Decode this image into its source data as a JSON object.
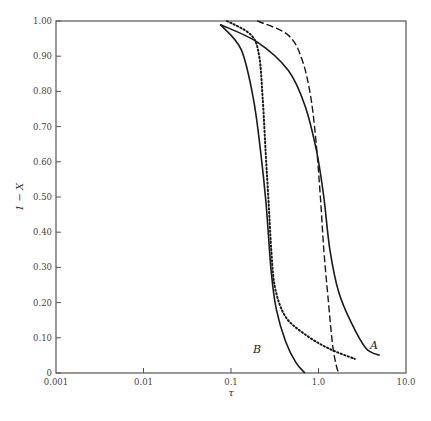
{
  "chart_data": {
    "type": "line",
    "title": "",
    "xlabel": "τ",
    "ylabel": "1 − X",
    "xscale": "log",
    "xlim": [
      0.001,
      10.0
    ],
    "ylim": [
      0,
      1.0
    ],
    "grid": false,
    "x_ticks": [
      "0.001",
      "0.01",
      "0.1",
      "1.0",
      "10.0"
    ],
    "y_ticks": [
      "0",
      "0.10",
      "0.20",
      "0.30",
      "0.40",
      "0.50",
      "0.60",
      "0.70",
      "0.80",
      "0.90",
      "1.00"
    ],
    "annotations": [
      {
        "text": "A",
        "x": 4.3,
        "y": 0.07
      },
      {
        "text": "B",
        "x": 0.25,
        "y": 0.07
      }
    ],
    "series": [
      {
        "name": "B (solid)",
        "style": "solid",
        "points": [
          [
            0.075,
            0.99
          ],
          [
            0.13,
            0.92
          ],
          [
            0.18,
            0.78
          ],
          [
            0.22,
            0.62
          ],
          [
            0.25,
            0.49
          ],
          [
            0.27,
            0.38
          ],
          [
            0.29,
            0.28
          ],
          [
            0.33,
            0.18
          ],
          [
            0.42,
            0.09
          ],
          [
            0.55,
            0.03
          ],
          [
            0.7,
            0.0
          ]
        ]
      },
      {
        "name": "A (solid)",
        "style": "solid",
        "points": [
          [
            0.075,
            0.99
          ],
          [
            0.2,
            0.94
          ],
          [
            0.45,
            0.86
          ],
          [
            0.7,
            0.76
          ],
          [
            0.95,
            0.63
          ],
          [
            1.15,
            0.5
          ],
          [
            1.35,
            0.35
          ],
          [
            1.7,
            0.23
          ],
          [
            2.4,
            0.14
          ],
          [
            3.5,
            0.07
          ],
          [
            5.0,
            0.05
          ]
        ]
      },
      {
        "name": "dashed",
        "style": "dashed",
        "points": [
          [
            0.2,
            1.0
          ],
          [
            0.45,
            0.96
          ],
          [
            0.65,
            0.89
          ],
          [
            0.82,
            0.78
          ],
          [
            0.95,
            0.64
          ],
          [
            1.05,
            0.5
          ],
          [
            1.15,
            0.35
          ],
          [
            1.3,
            0.2
          ],
          [
            1.45,
            0.08
          ],
          [
            1.6,
            0.02
          ],
          [
            1.7,
            0.0
          ]
        ]
      },
      {
        "name": "dotted",
        "style": "dotted",
        "points": [
          [
            0.09,
            1.0
          ],
          [
            0.17,
            0.96
          ],
          [
            0.21,
            0.9
          ],
          [
            0.23,
            0.78
          ],
          [
            0.25,
            0.62
          ],
          [
            0.27,
            0.48
          ],
          [
            0.29,
            0.34
          ],
          [
            0.32,
            0.24
          ],
          [
            0.42,
            0.16
          ],
          [
            0.7,
            0.11
          ],
          [
            1.3,
            0.07
          ],
          [
            2.6,
            0.04
          ]
        ]
      }
    ]
  },
  "axes": {
    "x_title": "τ",
    "y_title": "1 − X",
    "x_ticks": [
      "0.001",
      "0.01",
      "0.1",
      "1.0",
      "10.0"
    ],
    "y_ticks": [
      "0",
      "0.10",
      "0.20",
      "0.30",
      "0.40",
      "0.50",
      "0.60",
      "0.70",
      "0.80",
      "0.90",
      "1.00"
    ]
  },
  "labels": {
    "curve_a": "A",
    "curve_b": "B"
  },
  "colors": {
    "curve": "#1a1a1a",
    "frame": "#555555"
  }
}
